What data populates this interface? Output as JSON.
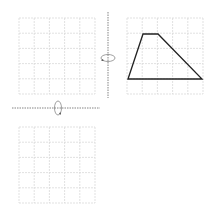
{
  "diagram": {
    "grid_cells": 5,
    "colors": {
      "grid": "#d9d9d9",
      "axis": "#777777",
      "shape": "#222222",
      "arrow": "#888888"
    },
    "grids": [
      {
        "id": "top-left",
        "x": 19,
        "y": 18,
        "size": 76,
        "shape": null
      },
      {
        "id": "top-right",
        "x": 127,
        "y": 18,
        "size": 76,
        "shape": {
          "type": "trapezoid",
          "points": [
            [
              128,
              79
            ],
            [
              143,
              34
            ],
            [
              158,
              34
            ],
            [
              202,
              79
            ]
          ]
        }
      },
      {
        "id": "bottom-left",
        "x": 19,
        "y": 127,
        "size": 76,
        "shape": null
      }
    ],
    "axes": [
      {
        "id": "vertical-axis",
        "x1": 108,
        "y1": 12,
        "x2": 108,
        "y2": 98
      },
      {
        "id": "horizontal-axis",
        "x1": 12,
        "y1": 108,
        "x2": 100,
        "y2": 108
      }
    ],
    "rotation_arrows": [
      {
        "id": "rotate-around-vertical",
        "cx": 108,
        "cy": 58,
        "orientation": "horizontal"
      },
      {
        "id": "rotate-around-horizontal",
        "cx": 58,
        "cy": 108,
        "orientation": "vertical"
      }
    ]
  }
}
